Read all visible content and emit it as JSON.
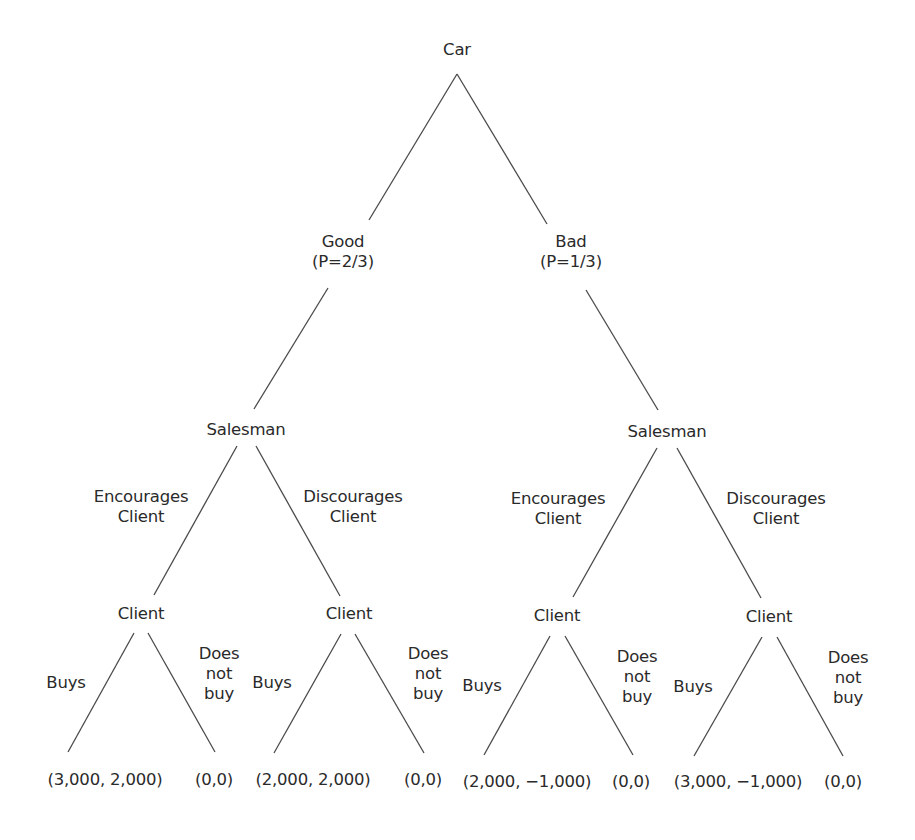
{
  "diagram": {
    "type": "game-tree",
    "root": {
      "label": "Car"
    },
    "nature_branches": [
      {
        "label": "Good",
        "probability": "(P=2/3)"
      },
      {
        "label": "Bad",
        "probability": "(P=1/3)"
      }
    ],
    "salesman_nodes": [
      {
        "label": "Salesman",
        "encourages": [
          "Encourages",
          "Client"
        ],
        "discourages": [
          "Discourages",
          "Client"
        ]
      },
      {
        "label": "Salesman",
        "encourages": [
          "Encourages",
          "Client"
        ],
        "discourages": [
          "Discourages",
          "Client"
        ]
      }
    ],
    "client_nodes": [
      {
        "label": "Client",
        "buys": "Buys",
        "not_buy": [
          "Does",
          "not",
          "buy"
        ],
        "payoff_buy": "(3,000, 2,000)",
        "payoff_not": "(0,0)"
      },
      {
        "label": "Client",
        "buys": "Buys",
        "not_buy": [
          "Does",
          "not",
          "buy"
        ],
        "payoff_buy": "(2,000, 2,000)",
        "payoff_not": "(0,0)"
      },
      {
        "label": "Client",
        "buys": "Buys",
        "not_buy": [
          "Does",
          "not",
          "buy"
        ],
        "payoff_buy": "(2,000, −1,000)",
        "payoff_not": "(0,0)"
      },
      {
        "label": "Client",
        "buys": "Buys",
        "not_buy": [
          "Does",
          "not",
          "buy"
        ],
        "payoff_buy": "(3,000, −1,000)",
        "payoff_not": "(0,0)"
      }
    ],
    "colors": {
      "line": "#4a4a4a",
      "text": "#2a2a2a",
      "background": "#ffffff"
    }
  }
}
